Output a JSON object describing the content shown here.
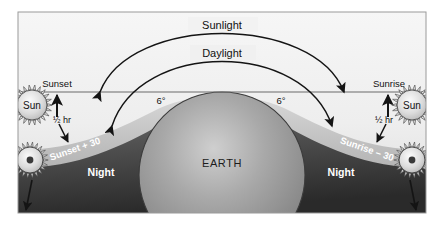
{
  "diagram": {
    "frame": {
      "x": 18,
      "y": 12,
      "width": 408,
      "height": 201
    },
    "background_color": "#ffffff",
    "sky_color_top": "#f2f2f2",
    "sky_color_horizon": "#d9d9d9",
    "night_color": "#4a4a4a",
    "night_color_dark": "#2b2b2b",
    "earth_color": "#9a9a9a",
    "line_color": "#1a1a1a",
    "sun_color": "#d6d6d6"
  },
  "arcs": {
    "sunlight": {
      "label": "Sunlight",
      "label_x": 222,
      "label_y": 25,
      "start_x": 100,
      "start_y": 92,
      "end_x": 344,
      "end_y": 92,
      "apex_y": 22,
      "arrow_left": true,
      "arrow_right": true
    },
    "daylight": {
      "label": "Daylight",
      "label_x": 222,
      "label_y": 53,
      "start_x": 108,
      "start_y": 126,
      "end_x": 336,
      "end_y": 126,
      "apex_y": 48,
      "arrow_left": true,
      "arrow_right": true
    }
  },
  "horizon": {
    "y": 92,
    "x_start": 18,
    "x_end": 426,
    "label": "horizon-line"
  },
  "earth": {
    "label": "EARTH",
    "center_x": 222,
    "center_y": 175,
    "radius": 83,
    "label_x": 222,
    "label_y": 163
  },
  "angles": [
    {
      "label": "6°",
      "x": 161,
      "y": 101,
      "side": "left"
    },
    {
      "label": "6°",
      "x": 281,
      "y": 101,
      "side": "right"
    }
  ],
  "night_labels": [
    {
      "label": "Night",
      "x": 101,
      "y": 172,
      "side": "left"
    },
    {
      "label": "Night",
      "x": 341,
      "y": 172,
      "side": "right"
    }
  ],
  "horizon_labels": [
    {
      "label": "Sunset",
      "x": 57,
      "y": 84,
      "side": "left"
    },
    {
      "label": "Sunrise",
      "x": 389,
      "y": 84,
      "side": "right"
    }
  ],
  "twilight_labels": [
    {
      "label": "Sunset + 30",
      "x": 76,
      "y": 151,
      "rotation": -19,
      "side": "left"
    },
    {
      "label": "Sunrise – 30",
      "x": 366,
      "y": 151,
      "rotation": 19,
      "side": "right"
    }
  ],
  "half_hour_labels": [
    {
      "label": "½ hr",
      "x": 61,
      "y": 120,
      "side": "left"
    },
    {
      "label": "½ hr",
      "x": 384,
      "y": 120,
      "side": "right"
    }
  ],
  "suns": [
    {
      "name": "sun-sunset-horizon",
      "label": "Sun",
      "cx": 32,
      "cy": 105,
      "radius": 15,
      "ray_count": 22,
      "has_center_dot": false,
      "show_label": true,
      "side": "left"
    },
    {
      "name": "sun-sunrise-horizon",
      "label": "Sun",
      "cx": 412,
      "cy": 105,
      "radius": 15,
      "ray_count": 22,
      "has_center_dot": false,
      "show_label": true,
      "side": "right"
    },
    {
      "name": "sun-sunset-plus-30",
      "label": "",
      "cx": 30,
      "cy": 160,
      "radius": 13,
      "ray_count": 22,
      "has_center_dot": true,
      "show_label": false,
      "side": "left"
    },
    {
      "name": "sun-sunrise-minus-30",
      "label": "",
      "cx": 412,
      "cy": 160,
      "radius": 13,
      "ray_count": 22,
      "has_center_dot": true,
      "show_label": false,
      "side": "right"
    }
  ],
  "arrows": [
    {
      "name": "arrow-sunset-up",
      "x1": 57,
      "y1": 119,
      "x2": 57,
      "y2": 95,
      "side": "left"
    },
    {
      "name": "arrow-sunrise-up",
      "x1": 388,
      "y1": 119,
      "x2": 388,
      "y2": 95,
      "side": "right"
    },
    {
      "name": "arrow-sunset-plus30-down",
      "x1": 60,
      "y1": 122,
      "x2": 69,
      "y2": 143,
      "side": "left"
    },
    {
      "name": "arrow-sunrise-minus30-down",
      "x1": 385,
      "y1": 122,
      "x2": 376,
      "y2": 143,
      "side": "right"
    },
    {
      "name": "arrow-lower-sun-left",
      "x1": 32,
      "y1": 179,
      "x2": 25,
      "y2": 211,
      "side": "left"
    },
    {
      "name": "arrow-lower-sun-right",
      "x1": 410,
      "y1": 179,
      "x2": 417,
      "y2": 211,
      "side": "right"
    }
  ]
}
